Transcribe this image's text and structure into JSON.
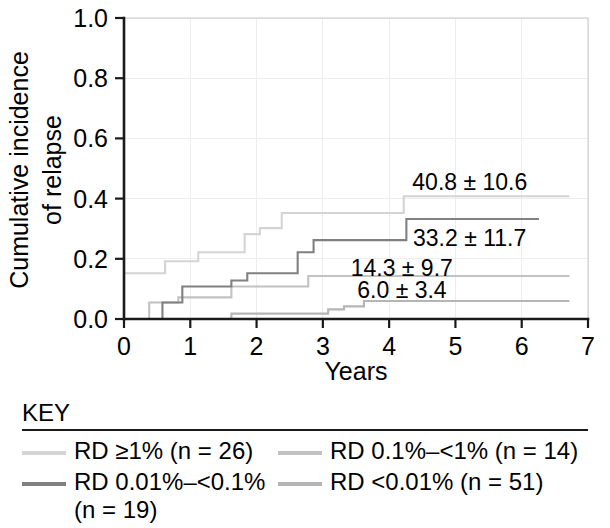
{
  "figure": {
    "y_axis_title_line1": "Cumulative incidence",
    "y_axis_title_line2": "of relapse",
    "x_axis_title": "Years"
  },
  "legend": {
    "title": "KEY",
    "items": [
      {
        "label": "RD ≥1% (n = 26)",
        "color": "#d4d4d4"
      },
      {
        "label": "RD 0.1%–<1% (n = 14)",
        "color": "#c2c2c2"
      },
      {
        "label": "RD 0.01%–<0.1%\n(n = 19)",
        "color": "#808080"
      },
      {
        "label": "RD <0.01% (n = 51)",
        "color": "#b5b5b5"
      }
    ]
  },
  "chart_data": {
    "type": "line",
    "subtype": "step-cumulative-incidence",
    "title": "",
    "xlabel": "Years",
    "ylabel": "Cumulative incidence of relapse",
    "xlim": [
      0,
      7
    ],
    "ylim": [
      0.0,
      1.0
    ],
    "xticks": [
      "0",
      "1",
      "2",
      "3",
      "4",
      "5",
      "6",
      "7"
    ],
    "xtick_values": [
      0,
      1,
      2,
      3,
      4,
      5,
      6,
      7
    ],
    "yticks": [
      "0.0",
      "0.2",
      "0.4",
      "0.6",
      "0.8",
      "1.0"
    ],
    "ytick_values": [
      0.0,
      0.2,
      0.4,
      0.6,
      0.8,
      1.0
    ],
    "grid": true,
    "legend_position": "below",
    "series": [
      {
        "name": "RD ≥1% (n = 26)",
        "color": "#d4d4d4",
        "endpoint_label": "40.8 ± 10.6",
        "label_x": 4.35,
        "label_y": 0.455,
        "x": [
          0.0,
          0.62,
          0.62,
          1.12,
          1.12,
          1.82,
          1.82,
          2.05,
          2.05,
          2.38,
          2.38,
          4.22,
          4.22,
          6.72
        ],
        "y": [
          0.152,
          0.152,
          0.192,
          0.192,
          0.222,
          0.222,
          0.282,
          0.282,
          0.302,
          0.302,
          0.352,
          0.352,
          0.408,
          0.408
        ]
      },
      {
        "name": "RD 0.1%–<1% (n = 14)",
        "color": "#c2c2c2",
        "endpoint_label": "14.3 ± 9.7",
        "label_x": 3.42,
        "label_y": 0.168,
        "x": [
          0.0,
          0.38,
          0.38,
          0.82,
          0.82,
          1.62,
          1.62,
          2.78,
          2.78,
          6.72
        ],
        "y": [
          0.0,
          0.0,
          0.055,
          0.055,
          0.072,
          0.072,
          0.108,
          0.108,
          0.143,
          0.143
        ]
      },
      {
        "name": "RD 0.01%–<0.1% (n = 19)",
        "color": "#808080",
        "endpoint_label": "33.2 ± 11.7",
        "label_x": 4.36,
        "label_y": 0.268,
        "x": [
          0.0,
          0.58,
          0.58,
          0.88,
          0.88,
          1.62,
          1.62,
          1.86,
          1.86,
          2.62,
          2.62,
          2.86,
          2.86,
          4.26,
          4.26,
          6.26
        ],
        "y": [
          0.0,
          0.0,
          0.055,
          0.055,
          0.108,
          0.108,
          0.128,
          0.128,
          0.152,
          0.152,
          0.222,
          0.222,
          0.262,
          0.262,
          0.332,
          0.332
        ]
      },
      {
        "name": "RD <0.01% (n = 51)",
        "color": "#b5b5b5",
        "endpoint_label": "6.0 ± 3.4",
        "label_x": 3.52,
        "label_y": 0.098,
        "x": [
          0.0,
          1.62,
          1.62,
          3.08,
          3.08,
          3.32,
          3.32,
          3.62,
          3.62,
          6.72
        ],
        "y": [
          0.0,
          0.0,
          0.018,
          0.018,
          0.032,
          0.032,
          0.042,
          0.042,
          0.06,
          0.06
        ]
      }
    ]
  }
}
